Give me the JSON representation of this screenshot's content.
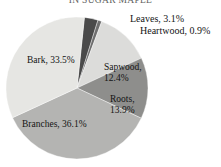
{
  "chart_data": {
    "type": "pie",
    "title": "IN SUGAR MAPLE",
    "xlabel": "",
    "ylabel": "",
    "legend_position": "none",
    "grid": false,
    "value_unit": "percent",
    "categories": [
      "Leaves",
      "Heartwood",
      "Sapwood",
      "Roots",
      "Branches",
      "Bark"
    ],
    "values": [
      3.1,
      0.9,
      12.4,
      13.9,
      36.1,
      33.5
    ],
    "slices": [
      {
        "name": "Leaves",
        "value": 3.1,
        "label": "Leaves, 3.1%",
        "color": "#4a4a4a",
        "label_placement": "outside"
      },
      {
        "name": "Heartwood",
        "value": 0.9,
        "label": "Heartwood, 0.9%",
        "color": "#6e6e6e",
        "label_placement": "outside"
      },
      {
        "name": "Sapwood",
        "value": 12.4,
        "label": "Sapwood,",
        "label_line2": "12.4%",
        "color": "#dcdcda",
        "label_placement": "inside"
      },
      {
        "name": "Roots",
        "value": 13.9,
        "label": "Roots,",
        "label_line2": "13.9%",
        "color": "#8e8e8c",
        "label_placement": "inside"
      },
      {
        "name": "Branches",
        "value": 36.1,
        "label": "Branches, 36.1%",
        "color": "#b4b4b2",
        "label_placement": "inside"
      },
      {
        "name": "Bark",
        "value": 33.5,
        "label": "Bark, 33.5%",
        "color": "#e6e6e3",
        "label_placement": "inside"
      }
    ]
  },
  "labels": {
    "leaves": "Leaves, 3.1%",
    "heartwood": "Heartwood, 0.9%",
    "bark": "Bark, 33.5%",
    "sapwood_line1": "Sapwood,",
    "sapwood_line2": "12.4%",
    "roots_line1": "Roots,",
    "roots_line2": "13.9%",
    "branches": "Branches, 36.1%"
  }
}
